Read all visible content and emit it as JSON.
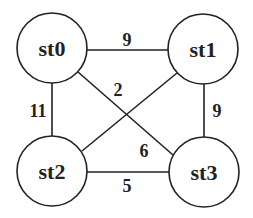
{
  "graph": {
    "nodes": [
      {
        "id": "st0",
        "label": "st0",
        "cx": 52,
        "cy": 48,
        "r": 35
      },
      {
        "id": "st1",
        "label": "st1",
        "cx": 203,
        "cy": 49,
        "r": 35
      },
      {
        "id": "st2",
        "label": "st2",
        "cx": 52,
        "cy": 171,
        "r": 35
      },
      {
        "id": "st3",
        "label": "st3",
        "cx": 204,
        "cy": 172,
        "r": 35
      }
    ],
    "edges": [
      {
        "from": "st0",
        "to": "st1",
        "weight": "9"
      },
      {
        "from": "st0",
        "to": "st2",
        "weight": "11"
      },
      {
        "from": "st0",
        "to": "st3",
        "weight": "2"
      },
      {
        "from": "st1",
        "to": "st2",
        "weight": "6"
      },
      {
        "from": "st1",
        "to": "st3",
        "weight": "9"
      },
      {
        "from": "st2",
        "to": "st3",
        "weight": "5"
      }
    ]
  },
  "colors": {
    "stroke": "#222222",
    "background": "#ffffff"
  }
}
